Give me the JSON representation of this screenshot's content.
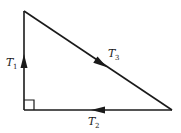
{
  "diagram": {
    "type": "force-triangle",
    "colors": {
      "line": "#1a1a1a",
      "background": "#ffffff"
    },
    "vertices": {
      "top": [
        24,
        11
      ],
      "right_angle": [
        24,
        110
      ],
      "right": [
        172,
        110
      ]
    },
    "sides": [
      {
        "id": "T1",
        "label_main": "T",
        "label_sub": "1",
        "direction": "up",
        "edge": "left-vertical"
      },
      {
        "id": "T3",
        "label_main": "T",
        "label_sub": "3",
        "direction": "down-right",
        "edge": "hypotenuse"
      },
      {
        "id": "T2",
        "label_main": "T",
        "label_sub": "2",
        "direction": "left",
        "edge": "bottom-horizontal"
      }
    ],
    "right_angle_marker": true
  }
}
